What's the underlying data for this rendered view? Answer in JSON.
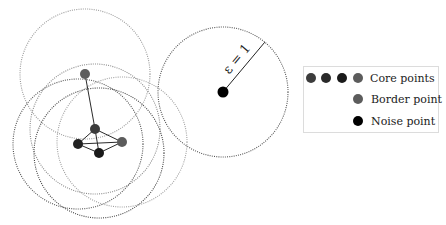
{
  "diagram": {
    "epsilon_label": "ε = 1",
    "radius": 65,
    "points": [
      {
        "id": "border",
        "type": "border",
        "x": 85,
        "y": 74,
        "color": "#5c5c5c"
      },
      {
        "id": "core-top",
        "type": "core",
        "x": 95,
        "y": 129,
        "color": "#3c3c3c"
      },
      {
        "id": "core-left",
        "type": "core",
        "x": 78,
        "y": 144,
        "color": "#222222"
      },
      {
        "id": "core-bottom",
        "type": "core",
        "x": 99,
        "y": 153,
        "color": "#1a1a1a"
      },
      {
        "id": "core-right",
        "type": "core",
        "x": 122,
        "y": 142,
        "color": "#5c5c5c"
      },
      {
        "id": "noise",
        "type": "noise",
        "x": 223,
        "y": 92,
        "color": "#000000"
      }
    ],
    "edges": [
      [
        "border",
        "core-top"
      ],
      [
        "core-top",
        "core-left"
      ],
      [
        "core-top",
        "core-bottom"
      ],
      [
        "core-top",
        "core-right"
      ],
      [
        "core-left",
        "core-bottom"
      ],
      [
        "core-left",
        "core-right"
      ],
      [
        "core-bottom",
        "core-right"
      ]
    ],
    "circles": [
      {
        "cx": 85,
        "cy": 74,
        "stroke": "#9a9a9a"
      },
      {
        "cx": 95,
        "cy": 129,
        "stroke": "#8a8a8a"
      },
      {
        "cx": 78,
        "cy": 144,
        "stroke": "#555555"
      },
      {
        "cx": 99,
        "cy": 153,
        "stroke": "#444444"
      },
      {
        "cx": 122,
        "cy": 142,
        "stroke": "#a0a0a0"
      },
      {
        "cx": 223,
        "cy": 92,
        "stroke": "#555555"
      }
    ]
  },
  "legend": {
    "items": [
      {
        "label": "Core points",
        "dots": [
          "#3c3c3c",
          "#2a2a2a",
          "#1a1a1a",
          "#5c5c5c"
        ]
      },
      {
        "label": "Border point",
        "dots": [
          "#5c5c5c"
        ]
      },
      {
        "label": "Noise point",
        "dots": [
          "#000000"
        ]
      }
    ]
  }
}
